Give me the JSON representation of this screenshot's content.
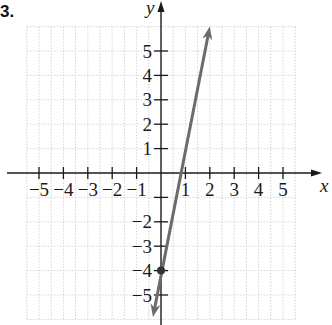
{
  "problem": {
    "number": "3."
  },
  "chart_data": {
    "type": "line",
    "title": "",
    "xlabel": "x",
    "ylabel": "y",
    "xlim": [
      -5.5,
      5.5
    ],
    "ylim": [
      -6,
      6
    ],
    "grid": true,
    "x_ticks": [
      -5,
      -4,
      -3,
      -2,
      -1,
      1,
      2,
      3,
      4,
      5
    ],
    "x_tick_labels": [
      "−5",
      "−4",
      "−3",
      "−2",
      "−1",
      "1",
      "2",
      "3",
      "4",
      "5"
    ],
    "y_ticks": [
      5,
      4,
      3,
      2,
      1,
      -1,
      -2,
      -3,
      -4,
      -5
    ],
    "y_tick_labels": [
      "5",
      "4",
      "3",
      "2",
      "1",
      "",
      "−2",
      "−3",
      "−4",
      "−5"
    ],
    "series": [
      {
        "name": "y = 5x − 4",
        "slope": 5,
        "intercept": -4,
        "x": [
          -0.33,
          2.0
        ],
        "y": [
          -5.9,
          6.0
        ],
        "color": "#6b6b6b",
        "arrows": "both",
        "marked_points": [
          {
            "x": 0,
            "y": -4
          }
        ]
      }
    ]
  }
}
